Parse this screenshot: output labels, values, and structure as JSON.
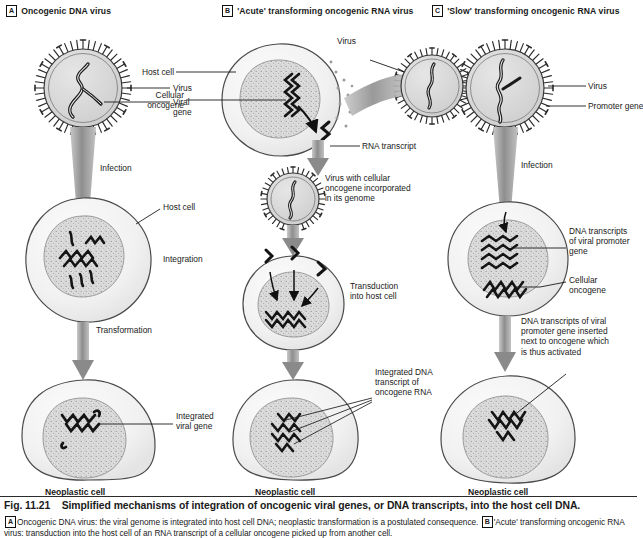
{
  "figure": {
    "number": "Fig. 11.21",
    "title": "Simplified mechanisms of integration of oncogenic viral genes, or DNA transcripts, into the host cell DNA.",
    "caption_parts": {
      "a_marker": "A",
      "a_text": "Oncogenic DNA virus: the viral genome is integrated into host cell DNA; neoplastic transformation is a postulated consequence.",
      "b_marker": "B",
      "b_text": "'Acute' transforming oncogenic RNA virus: transduction into the host cell of an RNA transcript of a cellular oncogene picked up from another cell."
    }
  },
  "panels": [
    {
      "marker": "A",
      "title": "Oncogenic DNA virus",
      "labels": [
        {
          "name": "virus",
          "text": "Virus"
        },
        {
          "name": "viral-gene",
          "text": "Viral\ngene"
        },
        {
          "name": "infection",
          "text": "Infection"
        },
        {
          "name": "host-cell",
          "text": "Host cell"
        },
        {
          "name": "integration",
          "text": "Integration"
        },
        {
          "name": "transformation",
          "text": "Transformation"
        },
        {
          "name": "integrated-viral-gene",
          "text": "Integrated\nviral gene"
        }
      ],
      "end_label": "Neoplastic cell"
    },
    {
      "marker": "B",
      "title": "'Acute' transforming oncogenic RNA virus",
      "labels": [
        {
          "name": "host-cell",
          "text": "Host cell"
        },
        {
          "name": "cellular-oncogene",
          "text": "Cellular\noncogene"
        },
        {
          "name": "virus",
          "text": "Virus"
        },
        {
          "name": "rna-transcript",
          "text": "RNA transcript"
        },
        {
          "name": "virus-with-oncogene",
          "text": "Virus with cellular\noncogene incorporated\nin its genome"
        },
        {
          "name": "transduction",
          "text": "Transduction\ninto host cell"
        },
        {
          "name": "integrated-dna-transcript",
          "text": "Integrated DNA\ntranscript of\noncogene RNA"
        }
      ],
      "end_label": "Neoplastic cell"
    },
    {
      "marker": "C",
      "title": "'Slow' transforming oncogenic RNA virus",
      "labels": [
        {
          "name": "virus",
          "text": "Virus"
        },
        {
          "name": "promoter-gene",
          "text": "Promoter gene"
        },
        {
          "name": "infection",
          "text": "Infection"
        },
        {
          "name": "dna-transcripts-promoter",
          "text": "DNA transcripts\nof viral promoter\ngene"
        },
        {
          "name": "cellular-oncogene",
          "text": "Cellular\noncogene"
        },
        {
          "name": "inserted-note",
          "text": "DNA transcripts of viral\npromoter gene inserted\nnext to oncogene which\nis thus activated"
        }
      ],
      "end_label": "Neoplastic cell"
    }
  ],
  "colors": {
    "ink": "#1a1a1a",
    "outline": "#555555",
    "cytoplasm": "#f2f2f2",
    "nucleus": "#d9d9d9",
    "arrow": "#9a9a9a",
    "capsid": "#d6d6d6"
  }
}
